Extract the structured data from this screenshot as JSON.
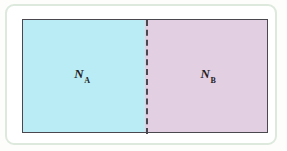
{
  "figure": {
    "type": "two-chamber-partition-diagram",
    "background_color": "#fdfdfb",
    "outer_frame": {
      "name": "rounded-panel-border",
      "stroke_color": "#dde9dc",
      "corner_radius_px": 9
    },
    "inner_box": {
      "name": "gas-container",
      "border_color": "#4a474e"
    },
    "partition": {
      "name": "removable-partition",
      "style": "dashed",
      "color": "#4a474e"
    },
    "chambers": [
      {
        "id": "A",
        "name": "chamber-a",
        "label_symbol": "N",
        "label_subscript": "A",
        "fill_color": "#b9ecf5"
      },
      {
        "id": "B",
        "name": "chamber-b",
        "label_symbol": "N",
        "label_subscript": "B",
        "fill_color": "#e3cfe2"
      }
    ]
  }
}
